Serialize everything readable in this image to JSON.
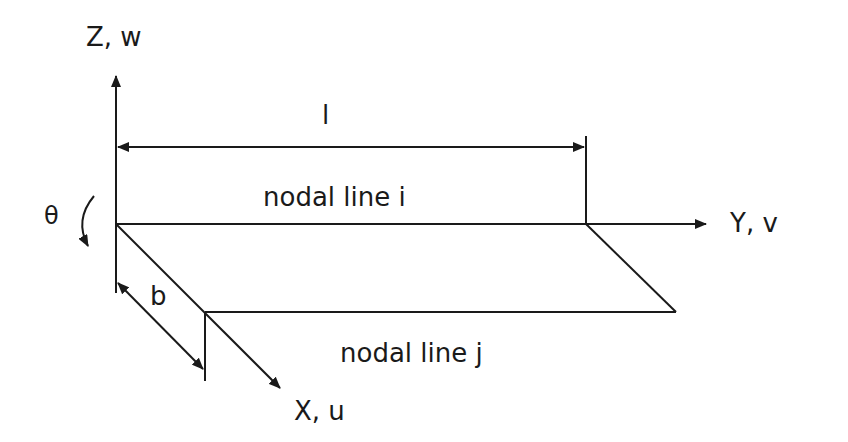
{
  "diagram": {
    "type": "strip-element-coordinate-system",
    "colors": {
      "ink": "#1a1a1a",
      "background": "#ffffff"
    },
    "axes": {
      "z": {
        "label": "Z, w",
        "direction": "up"
      },
      "y": {
        "label": "Y, v",
        "direction": "right"
      },
      "x": {
        "label": "X, u",
        "direction": "down-right (oblique)"
      }
    },
    "rotation": {
      "label": "θ",
      "icon": "curved-arrow-icon"
    },
    "dimensions": {
      "length": {
        "label": "l"
      },
      "width": {
        "label": "b"
      }
    },
    "nodal_lines": [
      {
        "label": "nodal line i"
      },
      {
        "label": "nodal line j"
      }
    ]
  }
}
